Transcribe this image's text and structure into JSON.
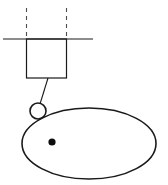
{
  "canvas": {
    "width": 168,
    "height": 185,
    "background_color": "#ffffff"
  },
  "style": {
    "line_color": "#1a1a1a",
    "dashed_line_color": "#4d4d4d",
    "dot_color": "#0d0d0d",
    "thin_stroke_width": 1.1,
    "medium_stroke_width": 1.4,
    "ellipse_stroke_width": 1.6
  },
  "figure": {
    "type": "line-drawing",
    "title": "",
    "elements": [
      {
        "name": "horizontal-baseline",
        "shape": "line",
        "x1": 3,
        "y1": 39,
        "x2": 93,
        "y2": 39
      },
      {
        "name": "dashed-line-left",
        "shape": "dashed-line",
        "x1": 26.5,
        "y1": 8,
        "x2": 26.5,
        "y2": 39,
        "dash_pattern": "4 4"
      },
      {
        "name": "dashed-line-right",
        "shape": "dashed-line",
        "x1": 66.5,
        "y1": 8,
        "x2": 66.5,
        "y2": 39,
        "dash_pattern": "4 4"
      },
      {
        "name": "rectangle-body",
        "shape": "rect",
        "x": 26.5,
        "y": 39,
        "width": 40,
        "height": 39
      },
      {
        "name": "connector-line",
        "shape": "line",
        "x1": 48,
        "y1": 78,
        "x2": 40,
        "y2": 104
      },
      {
        "name": "small-circle",
        "shape": "circle",
        "cx": 38,
        "cy": 111,
        "r": 8
      },
      {
        "name": "large-ellipse",
        "shape": "ellipse",
        "cx": 89,
        "cy": 143.5,
        "rx": 67,
        "ry": 35.5
      },
      {
        "name": "center-dot",
        "shape": "filled-circle",
        "cx": 52,
        "cy": 142,
        "r": 3.6
      }
    ]
  },
  "labels": {
    "none_visible": ""
  }
}
